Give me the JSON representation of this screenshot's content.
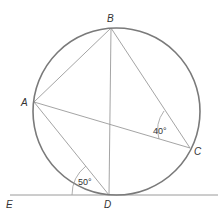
{
  "diagram": {
    "type": "circle-geometry",
    "colors": {
      "circle": "#7a7a7a",
      "lines": "#9a9a9a",
      "text": "#333333"
    },
    "circle": {
      "cx": 116.5,
      "cy": 111.5,
      "r": 83.5
    },
    "points": {
      "A": {
        "label": "A",
        "x": 34,
        "y": 102
      },
      "B": {
        "label": "B",
        "x": 111,
        "y": 28
      },
      "C": {
        "label": "C",
        "x": 190,
        "y": 148
      },
      "D": {
        "label": "D",
        "x": 109,
        "y": 195
      },
      "E": {
        "label": "E",
        "x": 8,
        "y": 195
      }
    },
    "segments": [
      "AB",
      "BC",
      "BD",
      "AC",
      "AD"
    ],
    "tangent_line": {
      "through": "D",
      "from": "E",
      "label": "E"
    },
    "angles": [
      {
        "name": "angle-ACB",
        "value": "40°"
      },
      {
        "name": "angle-ADE",
        "value": "50°"
      }
    ]
  }
}
